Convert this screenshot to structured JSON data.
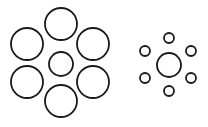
{
  "diagram": {
    "stroke_color": "#1a1a1a",
    "fill_color": "#ffffff",
    "groups": [
      {
        "name": "large-surround-group",
        "center": {
          "cx": 61,
          "cy": 64,
          "r": 12
        },
        "surround": [
          {
            "cx": 61,
            "cy": 24,
            "r": 16
          },
          {
            "cx": 27,
            "cy": 44,
            "r": 16
          },
          {
            "cx": 93,
            "cy": 44,
            "r": 16
          },
          {
            "cx": 27,
            "cy": 82,
            "r": 16
          },
          {
            "cx": 93,
            "cy": 82,
            "r": 16
          },
          {
            "cx": 61,
            "cy": 101,
            "r": 16
          }
        ]
      },
      {
        "name": "small-surround-group",
        "center": {
          "cx": 169,
          "cy": 65,
          "r": 12
        },
        "surround": [
          {
            "cx": 169,
            "cy": 38,
            "r": 5
          },
          {
            "cx": 145,
            "cy": 51,
            "r": 5
          },
          {
            "cx": 191,
            "cy": 51,
            "r": 5
          },
          {
            "cx": 145,
            "cy": 78,
            "r": 5
          },
          {
            "cx": 191,
            "cy": 78,
            "r": 5
          },
          {
            "cx": 169,
            "cy": 91,
            "r": 5
          }
        ]
      }
    ]
  }
}
